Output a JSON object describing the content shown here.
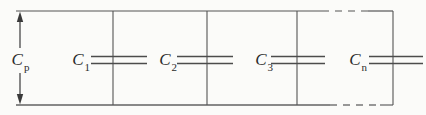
{
  "figure": {
    "labels": {
      "equivalent": {
        "base": "C",
        "sub": "p"
      },
      "capacitors": [
        {
          "base": "C",
          "sub": "1"
        },
        {
          "base": "C",
          "sub": "2"
        },
        {
          "base": "C",
          "sub": "3"
        },
        {
          "base": "C",
          "sub": "n"
        }
      ]
    },
    "colors": {
      "wire": "#555555",
      "bottom_rail": "#888888",
      "text": "#2b2b2b",
      "background": "#fbfbf9"
    }
  }
}
